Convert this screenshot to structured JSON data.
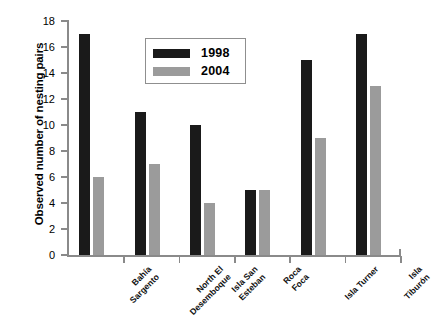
{
  "chart_data": {
    "type": "bar",
    "title": "",
    "xlabel": "",
    "ylabel": "Observed number of nesting pairs",
    "ylim": [
      0,
      18
    ],
    "ytick_step": 2,
    "yticks": [
      0,
      2,
      4,
      6,
      8,
      10,
      12,
      14,
      16,
      18
    ],
    "grid": false,
    "legend_position": "upper-center-left",
    "categories": [
      "Bahía\nSargento",
      "North El\nDesemboque",
      "Isla San\nEsteban",
      "Roca\nFoca",
      "Isla Turner",
      "Isla\nTiburón"
    ],
    "series": [
      {
        "name": "1998",
        "color": "#1a1a1a",
        "values": [
          17,
          11,
          10,
          5,
          15,
          17
        ]
      },
      {
        "name": "2004",
        "color": "#9b9b9b",
        "values": [
          6,
          7,
          4,
          5,
          9,
          13
        ]
      }
    ]
  },
  "legend": {
    "items": [
      {
        "label": "1998",
        "swatch": "#1a1a1a"
      },
      {
        "label": "2004",
        "swatch": "#9b9b9b"
      }
    ]
  },
  "axes": {
    "y_title": "Observed number of nesting pairs",
    "y_tick_labels": [
      "18",
      "16",
      "14",
      "12",
      "10",
      "8",
      "6",
      "4",
      "2",
      "0"
    ],
    "x_tick_labels": [
      "Bahía\nSargento",
      "North El\nDesemboque",
      "Isla San\nEsteban",
      "Roca\nFoca",
      "Isla Turner",
      "Isla\nTiburón"
    ]
  }
}
